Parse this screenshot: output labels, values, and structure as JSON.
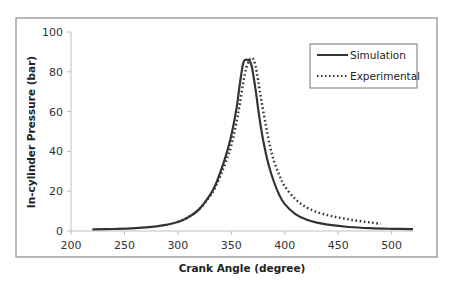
{
  "chart_data": {
    "type": "line",
    "title": "",
    "xlabel": "Crank Angle (degree)",
    "ylabel": "In-cylinder Pressure (bar)",
    "xlim": [
      200,
      520
    ],
    "ylim": [
      0,
      100
    ],
    "xticks": [
      200,
      250,
      300,
      350,
      400,
      450,
      500
    ],
    "yticks": [
      0,
      20,
      40,
      60,
      80,
      100
    ],
    "grid": false,
    "legend_position": "top-right",
    "series": [
      {
        "name": "Simulation",
        "style": "solid",
        "color": "#333333",
        "x": [
          220,
          240,
          260,
          280,
          290,
          300,
          310,
          320,
          330,
          335,
          340,
          345,
          350,
          355,
          358,
          361,
          363,
          365,
          367,
          369,
          371,
          373,
          376,
          380,
          385,
          390,
          395,
          400,
          410,
          420,
          430,
          440,
          460,
          480,
          500,
          520
        ],
        "y": [
          0.8,
          1.0,
          1.4,
          2.3,
          3.2,
          4.5,
          7.0,
          11.0,
          18.0,
          23.0,
          30.0,
          38.0,
          48.0,
          62.0,
          74.0,
          84.0,
          86.0,
          86.0,
          85.5,
          83.0,
          77.0,
          70.0,
          58.0,
          45.0,
          33.0,
          24.5,
          18.0,
          13.5,
          8.5,
          5.8,
          4.2,
          3.2,
          2.0,
          1.4,
          1.1,
          0.9
        ]
      },
      {
        "name": "Experimental",
        "style": "dotted",
        "color": "#333333",
        "x": [
          300,
          310,
          320,
          330,
          335,
          340,
          345,
          350,
          355,
          358,
          361,
          364,
          367,
          369,
          371,
          373,
          375,
          378,
          382,
          386,
          390,
          395,
          400,
          410,
          420,
          430,
          440,
          450,
          460,
          470,
          480,
          490
        ],
        "y": [
          4.5,
          7.0,
          11.0,
          17.5,
          22.0,
          28.0,
          35.0,
          43.0,
          55.0,
          64.0,
          74.0,
          82.0,
          86.0,
          87.0,
          86.0,
          82.0,
          76.0,
          66.0,
          54.0,
          43.0,
          35.0,
          28.0,
          22.5,
          16.0,
          12.0,
          9.5,
          8.0,
          6.8,
          5.8,
          5.0,
          4.3,
          3.6
        ]
      }
    ]
  }
}
